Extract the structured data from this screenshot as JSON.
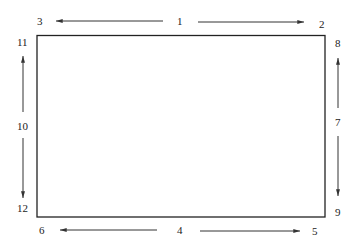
{
  "diagram": {
    "type": "rectangle-edge-labels",
    "rectangle": {
      "x": 37,
      "y": 35,
      "width": 288,
      "height": 182
    },
    "labels": {
      "top_left": "3",
      "top_center": "1",
      "top_right": "2",
      "right_top": "8",
      "right_center": "7",
      "right_bottom": "9",
      "bottom_left": "6",
      "bottom_center": "4",
      "bottom_right": "5",
      "left_top": "11",
      "left_center": "10",
      "left_bottom": "12"
    },
    "arrows": [
      {
        "from": "1",
        "to": "3",
        "direction": "left"
      },
      {
        "from": "1",
        "to": "2",
        "direction": "right"
      },
      {
        "from": "7",
        "to": "8",
        "direction": "up"
      },
      {
        "from": "7",
        "to": "9",
        "direction": "down"
      },
      {
        "from": "4",
        "to": "6",
        "direction": "left"
      },
      {
        "from": "4",
        "to": "5",
        "direction": "right"
      },
      {
        "from": "10",
        "to": "11",
        "direction": "up"
      },
      {
        "from": "10",
        "to": "12",
        "direction": "down"
      }
    ]
  }
}
